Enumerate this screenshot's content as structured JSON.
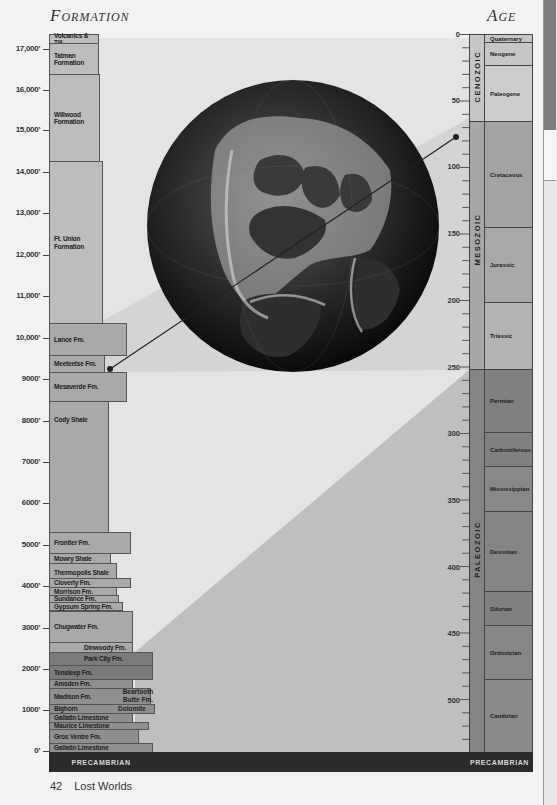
{
  "headers": {
    "formation": "Formation",
    "age": "Age"
  },
  "depth_axis": {
    "unit": "feet",
    "ticks": [
      "17,000'",
      "16,000'",
      "15,000'",
      "14,000'",
      "13,000'",
      "12,000'",
      "11,000'",
      "10,000'",
      "9000'",
      "8000'",
      "7000'",
      "6000'",
      "5000'",
      "4000'",
      "3000'",
      "2000'",
      "1000'",
      "0'"
    ]
  },
  "formations": [
    {
      "name": "Volcanics & Till"
    },
    {
      "name": "Tatman Formation"
    },
    {
      "name": "Willwood Formation"
    },
    {
      "name": "Ft. Union Formation"
    },
    {
      "name": "Lance Fm."
    },
    {
      "name": "Meeteetse Fm."
    },
    {
      "name": "Mesaverde Fm."
    },
    {
      "name": "Cody Shale"
    },
    {
      "name": "Frontier Fm."
    },
    {
      "name": "Mowry Shale"
    },
    {
      "name": "Thermopolis Shale"
    },
    {
      "name": "Cloverly Fm."
    },
    {
      "name": "Morrison Fm."
    },
    {
      "name": "Sundance Fm."
    },
    {
      "name": "Gypsum Spring Fm."
    },
    {
      "name": "Chugwater Fm."
    },
    {
      "name": "Dinwoody Fm."
    },
    {
      "name": "Park City Fm."
    },
    {
      "name": "Tensleep Fm."
    },
    {
      "name": "Amsden Fm."
    },
    {
      "name": "Madison Fm."
    },
    {
      "name": "Beartooth Butte Fm."
    },
    {
      "name": "Bighorn"
    },
    {
      "name": "Dolomite"
    },
    {
      "name": "Gallatin Limestone"
    },
    {
      "name": "Maurice Limestone"
    },
    {
      "name": "Gros Ventre Fm."
    },
    {
      "name": "Gallatin Limestone"
    }
  ],
  "age_axis": {
    "unit": "Ma",
    "ticks": [
      "0",
      "50",
      "100",
      "150",
      "200",
      "250",
      "300",
      "350",
      "400",
      "450",
      "500"
    ]
  },
  "eras": [
    {
      "name": "CENOZOIC"
    },
    {
      "name": "MESOZOIC"
    },
    {
      "name": "PALEOZOIC"
    }
  ],
  "periods": [
    {
      "name": "Quaternary"
    },
    {
      "name": "Neogene"
    },
    {
      "name": "Paleogene"
    },
    {
      "name": "Cretaceous"
    },
    {
      "name": "Jurassic"
    },
    {
      "name": "Triassic"
    },
    {
      "name": "Permian"
    },
    {
      "name": "Carboniferous"
    },
    {
      "name": "Mississippian"
    },
    {
      "name": "Devonian"
    },
    {
      "name": "Silurian"
    },
    {
      "name": "Ordovician"
    },
    {
      "name": "Cambrian"
    }
  ],
  "precambrian_label": "PRECAMBRIAN",
  "globe": {
    "description": "paleogeographic globe"
  },
  "footer": {
    "page_number": "42",
    "title": "Lost Worlds"
  }
}
